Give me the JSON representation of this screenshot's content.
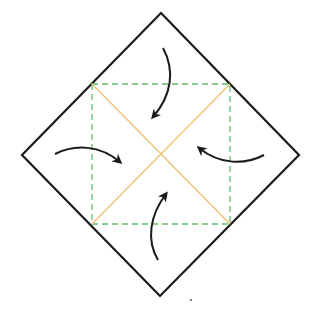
{
  "diagram": {
    "colors": {
      "background": "#ffffff",
      "outline": "#1a1a1a",
      "fold_guide": "#5fbf6a",
      "diagonal": "#f0c070",
      "arrow": "#1a1a1a"
    },
    "outer_diamond": {
      "top": [
        161,
        13
      ],
      "right": [
        299,
        155
      ],
      "bottom": [
        160,
        296
      ],
      "left": [
        22,
        155
      ]
    },
    "dashed_square": {
      "x1": 92,
      "y1": 84,
      "x2": 230,
      "y2": 224
    },
    "center": [
      161,
      155
    ],
    "arrows": [
      {
        "name": "top-fold-arrow",
        "path": "M163,48 C175,70 172,95 153,117",
        "tip": [
          153,
          118
        ],
        "direction": "down"
      },
      {
        "name": "left-fold-arrow",
        "path": "M55,154 C75,144 100,145 120,162",
        "tip": [
          121,
          162
        ],
        "direction": "right"
      },
      {
        "name": "right-fold-arrow",
        "path": "M264,155 C245,165 220,165 199,148",
        "tip": [
          198,
          148
        ],
        "direction": "left"
      },
      {
        "name": "bottom-fold-arrow",
        "path": "M158,260 C146,240 150,215 166,194",
        "tip": [
          166,
          193
        ],
        "direction": "up"
      }
    ],
    "stray_dot": [
      191,
      300
    ]
  }
}
